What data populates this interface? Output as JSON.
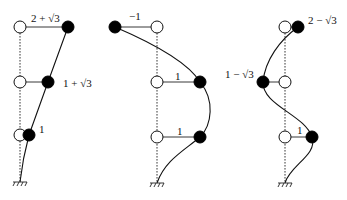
{
  "figure": {
    "modes": [
      {
        "name": "mode-1",
        "labels": {
          "top": "2 + √3",
          "middle": "1 + √3",
          "bottom": "1"
        },
        "amplitudes": [
          1,
          2.732,
          3.732
        ]
      },
      {
        "name": "mode-2",
        "labels": {
          "top": "−1",
          "middle": "1",
          "bottom": "1"
        },
        "amplitudes": [
          1,
          1,
          -1
        ]
      },
      {
        "name": "mode-3",
        "labels": {
          "top": "2 − √3",
          "middle": "1 − √3",
          "bottom": "1"
        },
        "amplitudes": [
          1,
          -0.732,
          0.268
        ]
      }
    ]
  }
}
